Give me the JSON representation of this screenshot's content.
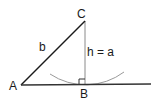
{
  "diagram": {
    "type": "geometry-triangle",
    "vertices": {
      "A": {
        "label": "A",
        "x": 21,
        "y": 85
      },
      "B": {
        "label": "B",
        "x": 85,
        "y": 85
      },
      "C": {
        "label": "C",
        "x": 85,
        "y": 21
      }
    },
    "labels": {
      "vertex_a": "A",
      "vertex_b": "B",
      "vertex_c": "C",
      "side_b": "b",
      "height": "h = a"
    },
    "segments": [
      {
        "name": "side-ac",
        "from": "A",
        "to": "C",
        "color": "#1a1a1a"
      },
      {
        "name": "baseline",
        "from": "A",
        "to_x": 151,
        "color": "#333333"
      },
      {
        "name": "altitude-cb",
        "from": "C",
        "to": "B",
        "color": "#8a8a8a"
      }
    ],
    "annotations": {
      "right_angle_at": "B",
      "arc": {
        "center": "C",
        "through": "B",
        "color": "#999999"
      }
    }
  }
}
